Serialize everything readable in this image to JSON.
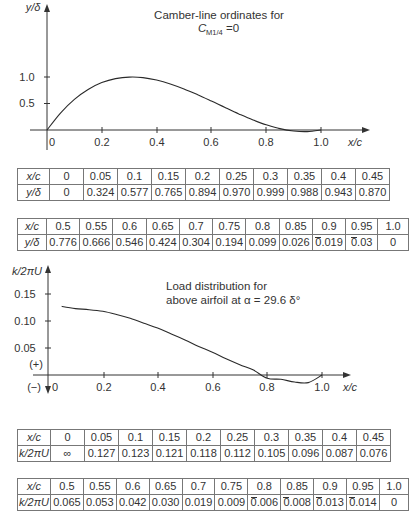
{
  "chart_data": [
    {
      "type": "line",
      "title": "Camber-line ordinates for C_M1/4 = 0",
      "title_line1": "Camber-line ordinates for",
      "title_line2_main": "C",
      "title_line2_sub": "M1/4",
      "title_line2_tail": "=0",
      "xlabel": "x/c",
      "ylabel": "y/δ",
      "x_ticks": [
        "0",
        "0.2",
        "0.4",
        "0.6",
        "0.8",
        "1.0"
      ],
      "y_ticks": [
        "0.5",
        "1.0"
      ],
      "xlim": [
        0,
        1.0
      ],
      "ylim": [
        -0.05,
        1.6
      ],
      "grid": false,
      "x": [
        0,
        0.05,
        0.1,
        0.15,
        0.2,
        0.25,
        0.3,
        0.35,
        0.4,
        0.45,
        0.5,
        0.55,
        0.6,
        0.65,
        0.7,
        0.75,
        0.8,
        0.85,
        0.9,
        0.95,
        1.0
      ],
      "values": [
        0,
        0.324,
        0.577,
        0.765,
        0.894,
        0.97,
        0.999,
        0.988,
        0.943,
        0.87,
        0.776,
        0.666,
        0.546,
        0.424,
        0.304,
        0.194,
        0.099,
        0.026,
        -0.019,
        -0.03,
        0
      ]
    },
    {
      "type": "line",
      "title": "Load distribution for above airfoil at α = 29.6 δ°",
      "title_line1": "Load distribution for",
      "title_line2": "above airfoil at α = 29.6 δ°",
      "xlabel": "x/c",
      "ylabel": "k/2πU",
      "x_ticks": [
        "0",
        "0.2",
        "0.4",
        "0.6",
        "0.8",
        "1.0"
      ],
      "y_ticks": [
        "0.05",
        "0.10",
        "0.15"
      ],
      "sign_labels": [
        "(+)",
        "(−)"
      ],
      "xlim": [
        0,
        1.0
      ],
      "ylim": [
        -0.03,
        0.17
      ],
      "grid": false,
      "x": [
        0,
        0.05,
        0.1,
        0.15,
        0.2,
        0.25,
        0.3,
        0.35,
        0.4,
        0.45,
        0.5,
        0.55,
        0.6,
        0.65,
        0.7,
        0.75,
        0.8,
        0.85,
        0.9,
        0.95,
        1.0
      ],
      "values": [
        "∞",
        0.127,
        0.123,
        0.121,
        0.118,
        0.112,
        0.105,
        0.096,
        0.087,
        0.076,
        0.065,
        0.053,
        0.042,
        0.03,
        0.019,
        0.009,
        -0.006,
        -0.008,
        -0.013,
        -0.014,
        0
      ]
    }
  ],
  "tables": {
    "camber_1": {
      "row_labels": [
        "x/c",
        "y/δ"
      ],
      "x": [
        "0",
        "0.05",
        "0.1",
        "0.15",
        "0.2",
        "0.25",
        "0.3",
        "0.35",
        "0.4",
        "0.45"
      ],
      "y": [
        "0",
        "0.324",
        "0.577",
        "0.765",
        "0.894",
        "0.970",
        "0.999",
        "0.988",
        "0.943",
        "0.870"
      ]
    },
    "camber_2": {
      "row_labels": [
        "x/c",
        "y/δ"
      ],
      "x": [
        "0.5",
        "0.55",
        "0.6",
        "0.65",
        "0.7",
        "0.75",
        "0.8",
        "0.85",
        "0.9",
        "0.95",
        "1.0"
      ],
      "y": [
        "0.776",
        "0.666",
        "0.546",
        "0.424",
        "0.304",
        "0.194",
        "0.099",
        "0.026",
        "0.019",
        "0.03",
        "0"
      ],
      "negative": [
        false,
        false,
        false,
        false,
        false,
        false,
        false,
        false,
        true,
        true,
        false
      ]
    },
    "load_1": {
      "row_labels": [
        "x/c",
        "k/2πU"
      ],
      "x": [
        "0",
        "0.05",
        "0.1",
        "0.15",
        "0.2",
        "0.25",
        "0.3",
        "0.35",
        "0.4",
        "0.45"
      ],
      "y": [
        "∞",
        "0.127",
        "0.123",
        "0.121",
        "0.118",
        "0.112",
        "0.105",
        "0.096",
        "0.087",
        "0.076"
      ]
    },
    "load_2": {
      "row_labels": [
        "x/c",
        "k/2πU"
      ],
      "x": [
        "0.5",
        "0.55",
        "0.6",
        "0.65",
        "0.7",
        "0.75",
        "0.8",
        "0.85",
        "0.9",
        "0.95",
        "1.0"
      ],
      "y": [
        "0.065",
        "0.053",
        "0.042",
        "0.030",
        "0.019",
        "0.009",
        "0.006",
        "0.008",
        "0.013",
        "0.014",
        "0"
      ],
      "negative": [
        false,
        false,
        false,
        false,
        false,
        false,
        true,
        true,
        true,
        true,
        false
      ]
    }
  },
  "colors": {
    "line": "#2a2a2a",
    "text": "#333333",
    "border": "#777777"
  }
}
